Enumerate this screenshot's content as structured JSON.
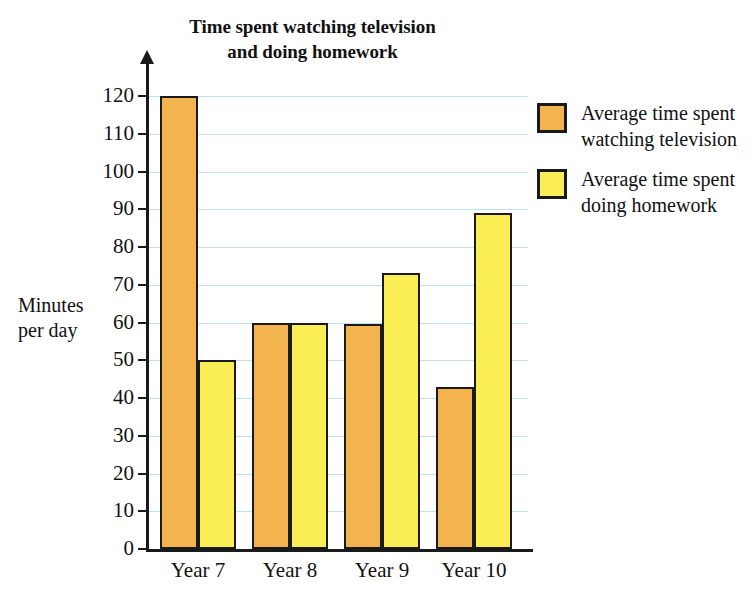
{
  "chart_data": {
    "type": "bar",
    "title": "Time spent watching television and doing homework",
    "title_lines": [
      "Time spent watching television",
      "and doing homework"
    ],
    "xlabel": "",
    "ylabel": "Minutes per day",
    "ylabel_lines": [
      "Minutes",
      "per day"
    ],
    "categories": [
      "Year 7",
      "Year 8",
      "Year 9",
      "Year 10"
    ],
    "series": [
      {
        "name": "Average time spent watching television",
        "name_lines": [
          "Average time spent",
          "watching television"
        ],
        "color": "#f3b44f",
        "values": [
          120,
          60,
          59.5,
          43
        ]
      },
      {
        "name": "Average time spent doing homework",
        "name_lines": [
          "Average time spent",
          "doing homework"
        ],
        "color": "#fbee55",
        "values": [
          50,
          60,
          73,
          89
        ]
      }
    ],
    "ylim": [
      0,
      120
    ],
    "ytick_step": 10,
    "yticks": [
      0,
      10,
      20,
      30,
      40,
      50,
      60,
      70,
      80,
      90,
      100,
      110,
      120
    ],
    "ytick_labels": [
      "0",
      "10",
      "20",
      "30",
      "40",
      "50",
      "60",
      "70",
      "80",
      "90",
      "100",
      "110",
      "120"
    ],
    "grid": true,
    "gridline_color": "#bfe2ef",
    "legend_position": "right",
    "axis_color": "#1a1a1a"
  }
}
